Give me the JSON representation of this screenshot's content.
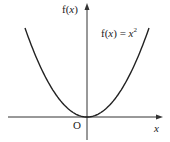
{
  "chart_data": {
    "type": "line",
    "title": "",
    "function": "f(x) = x^2",
    "series": [
      {
        "name": "f(x) = x²",
        "x": [
          -2,
          -1.5,
          -1,
          -0.5,
          0,
          0.5,
          1,
          1.5,
          2
        ],
        "y": [
          4,
          2.25,
          1,
          0.25,
          0,
          0.25,
          1,
          2.25,
          4
        ]
      }
    ],
    "xlabel": "x",
    "ylabel": "f(x)",
    "origin_label": "O",
    "annotation": "f(x) = x²",
    "grid": false,
    "legend": "none",
    "ticks": "none",
    "colors": {
      "curve": "#222222",
      "axes": "#333333"
    }
  },
  "labels": {
    "y_axis_f": "f(",
    "y_axis_x": "x",
    "y_axis_close": ")",
    "origin": "O",
    "x_axis": "x",
    "eq_f": "f(",
    "eq_x": "x",
    "eq_close": ") = ",
    "eq_var": "x",
    "eq_exp": "2"
  }
}
